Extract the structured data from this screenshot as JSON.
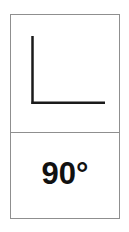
{
  "card": {
    "figure": "right-angle",
    "label": "90°",
    "colors": {
      "border": "#8f8f8f",
      "line": "#1a1a1a",
      "background": "#ffffff",
      "text": "#111111"
    }
  }
}
